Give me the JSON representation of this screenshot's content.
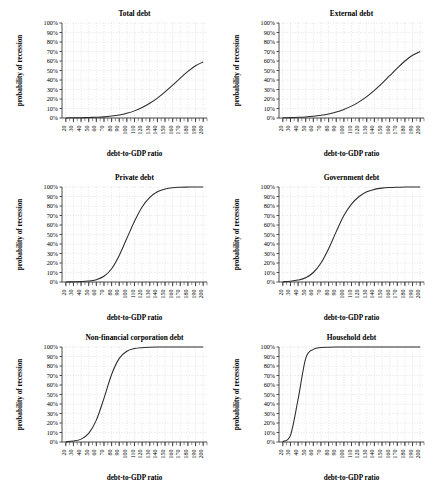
{
  "figure": {
    "panel_count": 6,
    "layout": "3 rows x 2 columns",
    "shared_xlabel": "debt-to-GDP ratio",
    "shared_ylabel": "probability of recession"
  },
  "axis": {
    "xlabel": "debt-to-GDP ratio",
    "ylabel": "probability of recession",
    "xticks": [
      20,
      30,
      40,
      50,
      60,
      70,
      80,
      90,
      100,
      110,
      120,
      130,
      140,
      150,
      160,
      170,
      180,
      190,
      200
    ],
    "xtick_labels": [
      "20",
      "30",
      "40",
      "50",
      "60",
      "70",
      "80",
      "90",
      "100",
      "110",
      "120",
      "130",
      "140",
      "150",
      "160",
      "170",
      "180",
      "190",
      "200"
    ],
    "yticks": [
      0,
      10,
      20,
      30,
      40,
      50,
      60,
      70,
      80,
      90,
      100
    ],
    "ytick_labels": [
      "0%",
      "10%",
      "20%",
      "30%",
      "40%",
      "50%",
      "60%",
      "70%",
      "80%",
      "90%",
      "100%"
    ],
    "xlim": [
      15,
      205
    ],
    "ylim": [
      0,
      100
    ],
    "minor_tick_step": 5,
    "grid": "dotted light gray, horizontal and vertical"
  },
  "colors": {
    "curve": "#2b2b2b",
    "grid": "#cfcfd6",
    "axis": "#3a3a3a",
    "background": "#ffffff",
    "text": "#1a1a1a"
  },
  "titles": {
    "p0": "Total debt",
    "p1": "External debt",
    "p2": "Private debt",
    "p3": "Government debt",
    "p4": "Non-financial corporation debt",
    "p5": "Household debt"
  },
  "chart_data": [
    {
      "type": "line",
      "title": "Total debt",
      "xlabel": "debt-to-GDP ratio",
      "ylabel": "probability of recession",
      "xlim": [
        15,
        205
      ],
      "ylim": [
        0,
        100
      ],
      "grid": true,
      "legend": "none",
      "x": [
        20,
        30,
        40,
        50,
        60,
        70,
        80,
        90,
        100,
        110,
        120,
        130,
        140,
        150,
        160,
        170,
        180,
        190,
        200
      ],
      "values": [
        0.1,
        0.2,
        0.3,
        0.5,
        0.8,
        1.2,
        2.0,
        3.2,
        5.0,
        7.5,
        11.0,
        15.5,
        21.0,
        27.5,
        34.5,
        42.0,
        49.0,
        55.0,
        59.0
      ]
    },
    {
      "type": "line",
      "title": "External debt",
      "xlabel": "debt-to-GDP ratio",
      "ylabel": "probability of recession",
      "xlim": [
        15,
        205
      ],
      "ylim": [
        0,
        100
      ],
      "grid": true,
      "legend": "none",
      "x": [
        20,
        30,
        40,
        50,
        60,
        70,
        80,
        90,
        100,
        110,
        120,
        130,
        140,
        150,
        160,
        170,
        180,
        190,
        200
      ],
      "values": [
        0.2,
        0.4,
        0.7,
        1.1,
        1.8,
        2.8,
        4.2,
        6.2,
        9.0,
        12.5,
        17.0,
        22.5,
        29.0,
        36.5,
        44.5,
        52.5,
        60.0,
        66.0,
        70.0
      ]
    },
    {
      "type": "line",
      "title": "Private debt",
      "xlabel": "debt-to-GDP ratio",
      "ylabel": "probability of recession",
      "xlim": [
        15,
        205
      ],
      "ylim": [
        0,
        100
      ],
      "grid": true,
      "legend": "none",
      "x": [
        20,
        30,
        40,
        50,
        60,
        70,
        80,
        90,
        100,
        110,
        120,
        130,
        140,
        150,
        160,
        170,
        180,
        190,
        200
      ],
      "values": [
        0.1,
        0.2,
        0.4,
        1.0,
        2.5,
        6.0,
        14.0,
        28.0,
        46.0,
        64.0,
        79.0,
        89.0,
        95.0,
        97.8,
        99.2,
        99.7,
        99.9,
        100,
        100
      ]
    },
    {
      "type": "line",
      "title": "Government debt",
      "xlabel": "debt-to-GDP ratio",
      "ylabel": "probability of recession",
      "xlim": [
        15,
        205
      ],
      "ylim": [
        0,
        100
      ],
      "grid": true,
      "legend": "none",
      "x": [
        20,
        30,
        40,
        50,
        60,
        70,
        80,
        90,
        100,
        110,
        120,
        130,
        140,
        150,
        160,
        170,
        180,
        190,
        200
      ],
      "values": [
        0.3,
        0.8,
        2.0,
        4.5,
        10.0,
        20.0,
        35.0,
        53.0,
        70.0,
        82.0,
        90.0,
        95.0,
        97.5,
        98.8,
        99.4,
        99.7,
        99.9,
        100,
        100
      ]
    },
    {
      "type": "line",
      "title": "Non-financial corporation debt",
      "xlabel": "debt-to-GDP ratio",
      "ylabel": "probability of recession",
      "xlim": [
        15,
        205
      ],
      "ylim": [
        0,
        100
      ],
      "grid": true,
      "legend": "none",
      "x": [
        20,
        30,
        40,
        50,
        60,
        70,
        80,
        90,
        100,
        110,
        120,
        130,
        140,
        150,
        160,
        170,
        180,
        190,
        200
      ],
      "values": [
        0.3,
        1.0,
        3.0,
        9.0,
        23.0,
        46.0,
        71.0,
        88.0,
        95.5,
        98.3,
        99.3,
        99.7,
        99.9,
        100,
        100,
        100,
        100,
        100,
        100
      ]
    },
    {
      "type": "line",
      "title": "Household debt",
      "xlabel": "debt-to-GDP ratio",
      "ylabel": "probability of recession",
      "xlim": [
        15,
        205
      ],
      "ylim": [
        0,
        100
      ],
      "grid": true,
      "legend": "none",
      "x": [
        20,
        30,
        40,
        50,
        60,
        70,
        80,
        90,
        100,
        110,
        120,
        130,
        140,
        150,
        160,
        170,
        180,
        190,
        200
      ],
      "values": [
        0.5,
        7.0,
        45.0,
        88.0,
        97.5,
        99.4,
        99.8,
        99.95,
        100,
        100,
        100,
        100,
        100,
        100,
        100,
        100,
        100,
        100,
        100
      ]
    }
  ]
}
